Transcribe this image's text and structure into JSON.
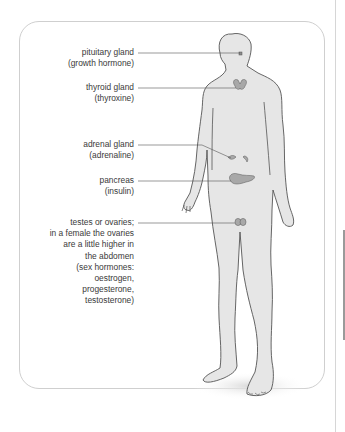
{
  "diagram": {
    "type": "labelled anatomical diagram",
    "figure_fill": "#e6e6e6",
    "outline_color": "#555555",
    "gland_color": "#a8a8a8",
    "labels": [
      {
        "id": "pituitary",
        "lines": [
          "pituitary gland",
          "(growth hormone)"
        ]
      },
      {
        "id": "thyroid",
        "lines": [
          "thyroid gland",
          "(thyroxine)"
        ]
      },
      {
        "id": "adrenal",
        "lines": [
          "adrenal gland",
          "(adrenaline)"
        ]
      },
      {
        "id": "pancreas",
        "lines": [
          "pancreas",
          "(insulin)"
        ]
      },
      {
        "id": "gonads",
        "lines": [
          "testes or ovaries;",
          "in a female the ovaries",
          "are a little higher in",
          "the abdomen",
          "(sex hormones:",
          "oestrogen,",
          "progesterone,",
          "testosterone)"
        ]
      }
    ]
  }
}
